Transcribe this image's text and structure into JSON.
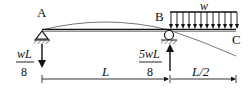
{
  "diagram": {
    "type": "beam-with-overhang",
    "points": {
      "A": {
        "label": "A",
        "support": "pin"
      },
      "B": {
        "label": "B",
        "support": "roller"
      },
      "C": {
        "label": "C",
        "support": "free-end"
      }
    },
    "load": {
      "label": "w",
      "type": "uniformly-distributed",
      "span": "B-C"
    },
    "reactions": {
      "A": {
        "numerator": "wL",
        "denominator": "8",
        "direction": "down"
      },
      "B": {
        "numerator": "5wL",
        "denominator": "8",
        "direction": "up"
      }
    },
    "dimensions": [
      {
        "label": "L",
        "from": "A",
        "to": "B"
      },
      {
        "label": "L/2",
        "from": "B",
        "to": "C"
      }
    ],
    "deflected_shape": "upward between A and B, downward on overhang B-C",
    "colors": {
      "line": "#111111",
      "curve": "#555555",
      "background": "#ffffff"
    }
  }
}
